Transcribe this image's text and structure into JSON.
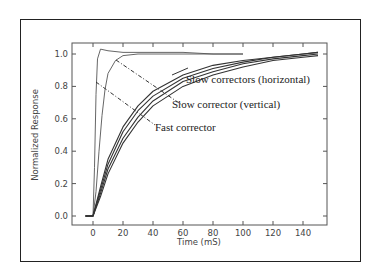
{
  "chart_data": {
    "type": "line",
    "title": "",
    "xlabel": "Time (mS)",
    "ylabel": "Normalized Response",
    "xlim": [
      -12,
      152
    ],
    "ylim": [
      -0.05,
      1.08
    ],
    "xticks": [
      "0",
      "20",
      "40",
      "60",
      "80",
      "100",
      "120",
      "140"
    ],
    "yticks": [
      "0.0",
      "0.2",
      "0.4",
      "0.6",
      "0.8",
      "1.0"
    ],
    "grid": false,
    "legend": "none (inline annotations)",
    "annotations": [
      {
        "text": "Slow correctors (horizontal)",
        "points_to": "slow horizontal curves"
      },
      {
        "text": "Slow corrector (vertical)",
        "points_to": "slow vertical curve"
      },
      {
        "text": "Fast corrector",
        "points_to": "fast corrector curves"
      }
    ],
    "series": [
      {
        "name": "Fast corrector (step)",
        "x": [
          -5,
          0,
          1,
          2,
          3,
          5,
          10,
          20,
          40,
          60,
          80,
          100
        ],
        "y": [
          0,
          0,
          0.3,
          0.75,
          0.97,
          1.03,
          1.02,
          1.01,
          1.01,
          1.01,
          1.0,
          1.0
        ]
      },
      {
        "name": "Fast corrector (slower)",
        "x": [
          -5,
          0,
          2,
          4,
          6,
          8,
          10,
          15,
          20,
          30,
          40,
          60,
          80,
          100
        ],
        "y": [
          0,
          0,
          0.15,
          0.4,
          0.62,
          0.78,
          0.88,
          0.96,
          0.99,
          1.0,
          1.0,
          1.0,
          1.0,
          1.0
        ]
      },
      {
        "name": "Slow corrector (vertical)",
        "x": [
          -5,
          0,
          5,
          10,
          20,
          30,
          40,
          60,
          80,
          100,
          120,
          140,
          150
        ],
        "y": [
          0,
          0,
          0.18,
          0.35,
          0.55,
          0.68,
          0.77,
          0.87,
          0.93,
          0.96,
          0.98,
          1.0,
          1.01
        ]
      },
      {
        "name": "Slow corrector (horizontal) 1",
        "x": [
          -5,
          0,
          5,
          10,
          20,
          30,
          40,
          60,
          80,
          100,
          120,
          140,
          150
        ],
        "y": [
          0,
          0,
          0.16,
          0.32,
          0.52,
          0.65,
          0.74,
          0.85,
          0.91,
          0.95,
          0.98,
          1.0,
          1.01
        ]
      },
      {
        "name": "Slow corrector (horizontal) 2",
        "x": [
          -5,
          0,
          5,
          10,
          20,
          30,
          40,
          60,
          80,
          100,
          120,
          140,
          150
        ],
        "y": [
          0,
          0,
          0.14,
          0.29,
          0.48,
          0.61,
          0.71,
          0.83,
          0.89,
          0.94,
          0.97,
          0.99,
          1.0
        ]
      },
      {
        "name": "Slow corrector (horizontal) 3",
        "x": [
          -5,
          0,
          5,
          10,
          20,
          30,
          40,
          60,
          80,
          100,
          120,
          140,
          150
        ],
        "y": [
          0,
          0,
          0.12,
          0.26,
          0.45,
          0.58,
          0.68,
          0.8,
          0.87,
          0.92,
          0.96,
          0.98,
          0.99
        ]
      }
    ]
  },
  "labels": {
    "xlabel": "Time (mS)",
    "ylabel": "Normalized Response",
    "xticks": [
      "0",
      "20",
      "40",
      "60",
      "80",
      "100",
      "120",
      "140"
    ],
    "yticks": [
      "0.0",
      "0.2",
      "0.4",
      "0.6",
      "0.8",
      "1.0"
    ],
    "anno_slow_h": "Slow correctors (horizontal)",
    "anno_slow_v": "Slow corrector (vertical)",
    "anno_fast": "Fast corrector"
  }
}
